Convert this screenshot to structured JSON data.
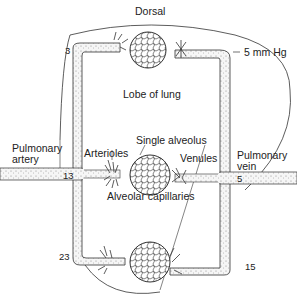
{
  "diagram": {
    "title_region": "Dorsal",
    "pressure_label": "5 mm Hg",
    "lobe_label": "Lobe of lung",
    "single_alveolus_label": "Single alveolus",
    "arterioles_label": "Arterioles",
    "venules_label": "Venules",
    "capillaries_label": "Alveolar capillaries",
    "pulmonary_artery_line1": "Pulmonary",
    "pulmonary_artery_line2": "artery",
    "pulmonary_vein_line1": "Pulmonary",
    "pulmonary_vein_line2": "vein",
    "pressures": {
      "top_left": "3",
      "mid_left": "13",
      "mid_right": "5",
      "bottom_left": "23",
      "bottom_right": "15"
    },
    "colors": {
      "line": "#333333",
      "vessel_fill": "#f4f4f4",
      "stipple": "#777777",
      "background": "#ffffff"
    }
  }
}
